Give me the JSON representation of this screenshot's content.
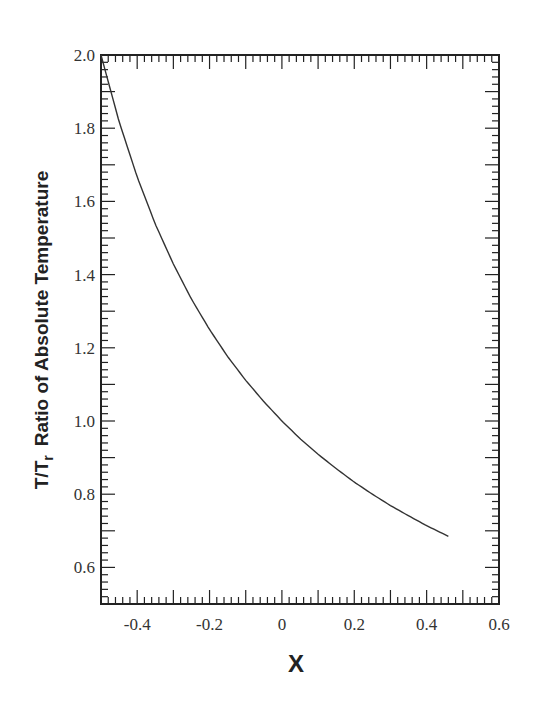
{
  "chart_data": {
    "type": "line",
    "title": "",
    "xlabel": "X",
    "ylabel": "T/T_r  Ratio of Absolute Temperature",
    "ylabel_parts": {
      "main": "T/T",
      "sub": "r",
      "rest": "Ratio of Absolute Temperature"
    },
    "xlim": [
      -0.5,
      0.6
    ],
    "ylim": [
      0.5,
      2.0
    ],
    "xticks": [
      -0.4,
      -0.2,
      0,
      0.2,
      0.4,
      0.6
    ],
    "xtick_labels": [
      "-0.4",
      "-0.2",
      "0",
      "0.2",
      "0.4",
      "0.6"
    ],
    "yticks": [
      0.6,
      0.8,
      1.0,
      1.2,
      1.4,
      1.6,
      1.8,
      2.0
    ],
    "ytick_labels": [
      "0.6",
      "0.8",
      "1.0",
      "1.2",
      "1.4",
      "1.6",
      "1.8",
      "2.0"
    ],
    "x_minor_step": 0.02,
    "y_minor_step": 0.02,
    "grid": false,
    "legend": null,
    "series": [
      {
        "name": "T/Tr = 1/(1+X)",
        "color": "#333333",
        "x": [
          -0.5,
          -0.45,
          -0.4,
          -0.35,
          -0.3,
          -0.25,
          -0.2,
          -0.15,
          -0.1,
          -0.05,
          0,
          0.05,
          0.1,
          0.15,
          0.2,
          0.25,
          0.3,
          0.35,
          0.4,
          0.46
        ],
        "y": [
          2.0,
          1.818,
          1.667,
          1.538,
          1.429,
          1.333,
          1.25,
          1.176,
          1.111,
          1.053,
          1.0,
          0.952,
          0.909,
          0.87,
          0.833,
          0.8,
          0.769,
          0.741,
          0.714,
          0.685
        ]
      }
    ]
  }
}
